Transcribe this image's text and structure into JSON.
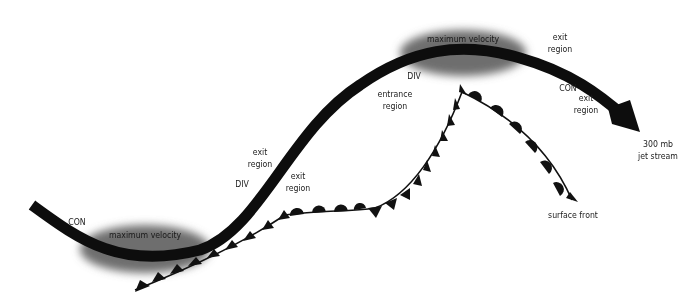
{
  "diagram": {
    "colors": {
      "jet_stream": "#0d0d0d",
      "max_velocity_ellipse": "#6e6e6e",
      "front": "#111111",
      "text": "#1a1a1a",
      "background": "#ffffff"
    },
    "max_velocity_left": {
      "label": "maximum velocity"
    },
    "max_velocity_right": {
      "label": "maximum velocity"
    },
    "labels": {
      "con_left": "CON",
      "div_left": "DIV",
      "exit_region_upper_left": [
        "exit",
        "region"
      ],
      "exit_region_lower_left": [
        "exit",
        "region"
      ],
      "div_upper": "DIV",
      "entrance_region": [
        "entrance",
        "region"
      ],
      "exit_region_top_right": [
        "exit",
        "region"
      ],
      "con_right": "CON",
      "exit_region_right": [
        "exit",
        "region"
      ],
      "jet_stream": [
        "300 mb",
        "jet stream"
      ],
      "surface_front": "surface front"
    }
  }
}
